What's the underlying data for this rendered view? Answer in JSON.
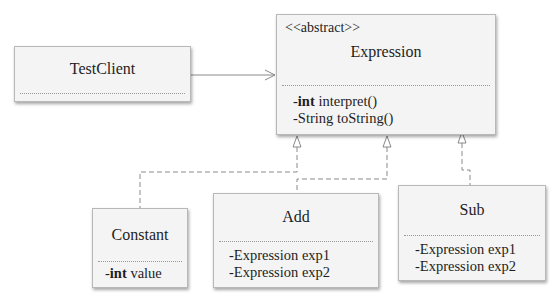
{
  "diagram": {
    "type": "UML class diagram",
    "classes": {
      "test_client": {
        "name": "TestClient",
        "members": []
      },
      "expression": {
        "stereotype": "<<abstract>>",
        "name": "Expression",
        "members": [
          {
            "modifier": "-",
            "type": "int",
            "type_bold": true,
            "text": " interpret()"
          },
          {
            "modifier": "-",
            "type": "String",
            "type_bold": false,
            "text": " toString()"
          }
        ]
      },
      "constant": {
        "name": "Constant",
        "members": [
          {
            "modifier": "-",
            "type": "int",
            "type_bold": true,
            "text": " value"
          }
        ]
      },
      "add": {
        "name": "Add",
        "members": [
          {
            "modifier": "-",
            "type": "Expression",
            "type_bold": false,
            "text": " exp1"
          },
          {
            "modifier": "-",
            "type": "Expression",
            "type_bold": false,
            "text": " exp2"
          }
        ]
      },
      "sub": {
        "name": "Sub",
        "members": [
          {
            "modifier": "-",
            "type": "Expression",
            "type_bold": false,
            "text": " exp1"
          },
          {
            "modifier": "-",
            "type": "Expression",
            "type_bold": false,
            "text": " exp2"
          }
        ]
      }
    },
    "relationships": [
      {
        "from": "TestClient",
        "to": "Expression",
        "kind": "association (open arrow)"
      },
      {
        "from": "Constant",
        "to": "Expression",
        "kind": "realization (dashed, hollow triangle)"
      },
      {
        "from": "Add",
        "to": "Expression",
        "kind": "realization (dashed, hollow triangle)"
      },
      {
        "from": "Sub",
        "to": "Expression",
        "kind": "realization (dashed, hollow triangle)"
      }
    ],
    "colors": {
      "box_fill": "#f4f4f4",
      "box_border": "#b8b8b8",
      "line": "#8a8a8a",
      "text": "#1e1e1e"
    }
  }
}
